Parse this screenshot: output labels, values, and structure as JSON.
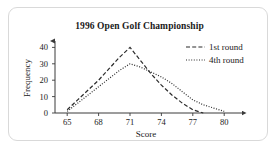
{
  "chart_data": {
    "type": "line",
    "title": "1996 Open Golf Championship",
    "xlabel": "Score",
    "ylabel": "Frequency",
    "xlim": [
      63.5,
      81.5
    ],
    "ylim": [
      0,
      43
    ],
    "xticks": [
      65,
      68,
      71,
      74,
      77,
      80
    ],
    "yticks": [
      0,
      10,
      20,
      30,
      40
    ],
    "grid": false,
    "legend_position": "top-right",
    "x": [
      65,
      66,
      67,
      68,
      69,
      70,
      71,
      72,
      73,
      74,
      75,
      76,
      77,
      78,
      79,
      80
    ],
    "series": [
      {
        "name": "1st round",
        "style": "dashed",
        "color": "#2b2b2b",
        "values": [
          2,
          8,
          14,
          20,
          27,
          34,
          40,
          32,
          24,
          17,
          11,
          6,
          2,
          0,
          null,
          null
        ]
      },
      {
        "name": "4th round",
        "style": "dotted",
        "color": "#2b2b2b",
        "values": [
          1,
          6,
          11,
          16,
          21,
          26,
          30,
          28,
          25,
          22,
          18,
          13,
          8,
          5,
          3,
          1
        ]
      }
    ]
  },
  "legend": {
    "entries": [
      {
        "label": "1st round",
        "style": "dashed"
      },
      {
        "label": "4th round",
        "style": "dotted"
      }
    ]
  },
  "axes": {
    "x_tick_labels": [
      "65",
      "68",
      "71",
      "74",
      "77",
      "80"
    ],
    "y_tick_labels": [
      "0",
      "10",
      "20",
      "30",
      "40"
    ],
    "x_axis_title": "Score",
    "y_axis_title": "Frequency"
  },
  "icons": {
    "x_axis_arrow": "arrow-right-icon",
    "y_axis_arrow": "arrow-up-icon"
  }
}
